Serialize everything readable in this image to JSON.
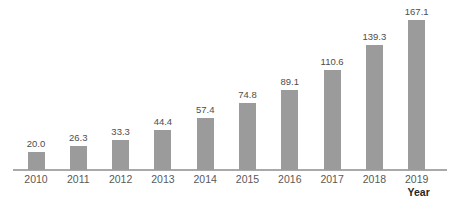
{
  "chart_data": {
    "type": "bar",
    "title": "",
    "xlabel": "Year",
    "ylabel": "",
    "categories": [
      "2010",
      "2011",
      "2012",
      "2013",
      "2014",
      "2015",
      "2016",
      "2017",
      "2018",
      "2019"
    ],
    "values": [
      20.0,
      26.3,
      33.3,
      44.4,
      57.4,
      74.8,
      89.1,
      110.6,
      139.3,
      167.1
    ],
    "value_labels": [
      "20.0",
      "26.3",
      "33.3",
      "44.4",
      "57.4",
      "74.8",
      "89.1",
      "110.6",
      "139.3",
      "167.1"
    ],
    "ylim": [
      0,
      185
    ],
    "grid": false,
    "legend": null,
    "colors": {
      "background": "#ffffff",
      "bar": "#9b9b9b",
      "axis_line": "#a9a9a9",
      "value_label": "#4d4d4d",
      "tick_label": "#595959",
      "xlabel": "#262626"
    }
  }
}
